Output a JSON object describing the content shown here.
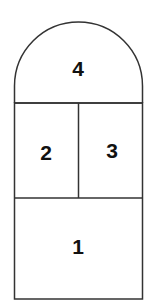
{
  "diagram": {
    "title": "",
    "stroke_color": "#333333",
    "label_color": "#111111",
    "regions": [
      {
        "id": "region-4",
        "label": "4",
        "shape": "semicircle-top"
      },
      {
        "id": "region-2",
        "label": "2",
        "shape": "rectangle"
      },
      {
        "id": "region-3",
        "label": "3",
        "shape": "rectangle"
      },
      {
        "id": "region-1",
        "label": "1",
        "shape": "rectangle"
      }
    ]
  }
}
